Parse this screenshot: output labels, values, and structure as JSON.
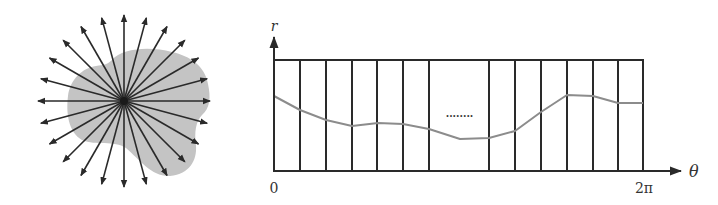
{
  "figure": {
    "left_panel": {
      "description": "Star-shaped region with rays emanating from center",
      "ray_count": 24,
      "center": [
        124,
        101
      ],
      "ray_length": 86,
      "blob_color": "#c4c4c4",
      "ray_color": "#2a2a2a"
    },
    "right_panel": {
      "y_axis_label": "r",
      "x_axis_label": "θ",
      "x_tick_start": "0",
      "x_tick_end": "2π",
      "ellipsis": "........",
      "frame_color": "#2a2a2a",
      "curve_color": "#8c8c8c"
    }
  },
  "chart_data": {
    "type": "line",
    "title": "",
    "xlabel": "θ",
    "ylabel": "r",
    "x_ticks": [
      "0",
      "2π"
    ],
    "xlim": [
      0,
      6.283
    ],
    "grid": "vertical strips (bins) across θ, gap with ellipsis in middle",
    "series": [
      {
        "name": "r(θ)",
        "x_px": [
          274,
          300,
          326,
          352,
          378,
          403,
          429,
          460,
          489,
          515,
          541,
          567,
          593,
          618,
          643
        ],
        "y_px": [
          96,
          110,
          120,
          126,
          123,
          124,
          129,
          139,
          138,
          131,
          112,
          95,
          96,
          103,
          103
        ]
      }
    ],
    "vertical_lines_px": [
      274,
      300,
      326,
      352,
      377,
      403,
      429,
      489,
      515,
      541,
      567,
      593,
      618,
      643
    ]
  }
}
